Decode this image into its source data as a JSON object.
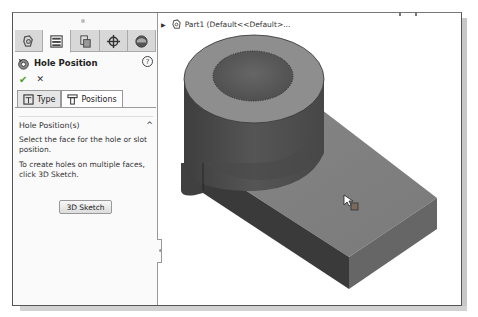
{
  "property_manager": {
    "tabs": [
      {
        "name": "feature-manager",
        "icon": "featuremanager-icon",
        "active": false
      },
      {
        "name": "property-manager",
        "icon": "propertymanager-icon",
        "active": true
      },
      {
        "name": "configuration-manager",
        "icon": "configurationmanager-icon",
        "active": false
      },
      {
        "name": "dimxpert-manager",
        "icon": "crosshair-icon",
        "active": false
      },
      {
        "name": "display-manager",
        "icon": "display-manager-icon",
        "active": false
      }
    ],
    "title": "Hole Position",
    "help_symbol": "?",
    "ok_symbol": "✔",
    "cancel_symbol": "✕",
    "subtabs": [
      {
        "label": "Type",
        "active": false
      },
      {
        "label": "Positions",
        "active": true
      }
    ],
    "group": {
      "title": "Hole Position(s)",
      "caret": "^",
      "instruction": "Select the face for the hole or slot position.",
      "hint": "To create holes on multiple faces, click 3D Sketch.",
      "button_label": "3D Sketch"
    }
  },
  "graphics": {
    "tree_label": "Part1  (Default<<Default>...",
    "model_colors": {
      "cyl_top": "#8f8f8f",
      "hole": "#5a5a5a",
      "cyl_side": "#4c4c4c",
      "block_top": "#7e7e7e",
      "block_front_left": "#3c3c3c",
      "block_front_right": "#656565"
    }
  }
}
